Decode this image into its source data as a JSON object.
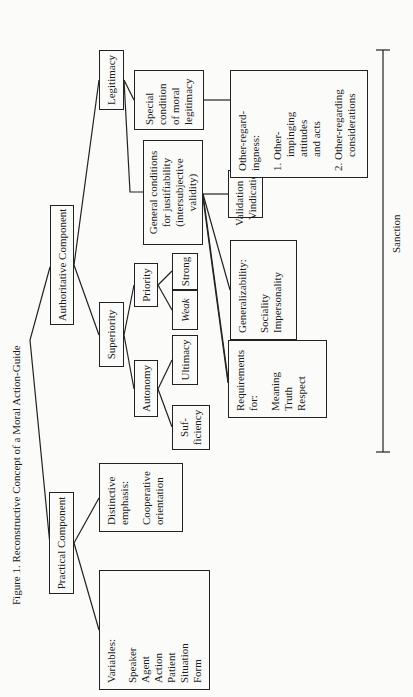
{
  "figure": {
    "title": "Figure 1.  Reconstructive Concept of a Moral Action-Guide",
    "orientation": "rotated 90° counter-clockwise on page"
  },
  "nodes": {
    "practical": {
      "label": "Practical Component"
    },
    "authoritative": {
      "label": "Authoritative Component"
    },
    "variables": {
      "heading": "Variables:",
      "items": [
        "Speaker",
        "Agent",
        "Action",
        "Patient",
        "Situation",
        "Form"
      ]
    },
    "distinctive": {
      "heading_1": "Distinctive",
      "heading_2": "emphasis:",
      "item_1": "Cooperative",
      "item_2": "orientation"
    },
    "superiority": {
      "label": "Superiority"
    },
    "legitimacy": {
      "label": "Legitimacy"
    },
    "autonomy": {
      "label": "Autonomy"
    },
    "priority": {
      "label": "Priority"
    },
    "sufficiency": {
      "line_1": "Suf-",
      "line_2": "ficiency"
    },
    "ultimacy": {
      "label": "Ultimacy"
    },
    "weak": {
      "label": "Weak"
    },
    "strong": {
      "label": "Strong"
    },
    "general_conditions": {
      "lines": [
        "General conditions",
        "for justifiability",
        "(intersubjective",
        "validity)"
      ]
    },
    "special_condition": {
      "lines": [
        "Special",
        "condition",
        "of moral",
        "legitimacy"
      ]
    },
    "requirements": {
      "heading_1": "Requirements",
      "heading_2": "for:",
      "items": [
        "Meaning",
        "Truth",
        "Respect"
      ]
    },
    "generalizability": {
      "heading": "Generalizability:",
      "items": [
        "Sociality",
        "Impersonality"
      ]
    },
    "validation": {
      "line_1": "Validation and",
      "line_2": "Vindication"
    },
    "other_regardingness": {
      "heading_1": "Other-regard-",
      "heading_2": "ingness:",
      "item_1_lines": [
        "1.  Other-",
        "impinging",
        "attitudes",
        "and acts"
      ],
      "item_2_lines": [
        "2.  Other-regarding",
        "considerations"
      ]
    }
  },
  "sanction": {
    "label": "Sanction"
  },
  "colors": {
    "ink": "#1a1a1a",
    "paper": "#fbfbf9"
  }
}
